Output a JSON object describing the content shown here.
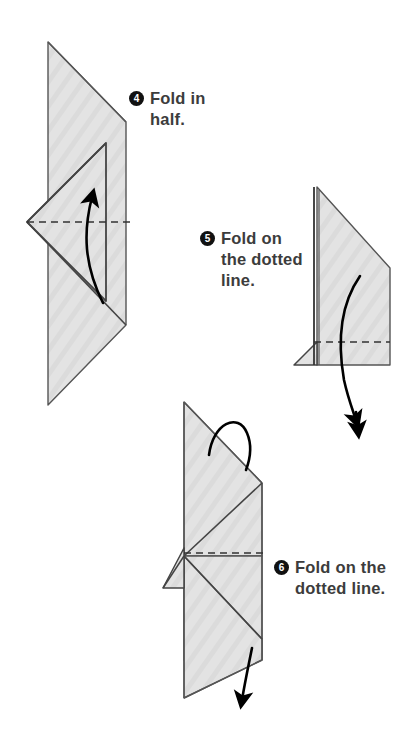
{
  "document": {
    "title": "Origami Folding Instructions",
    "background_color": "#ffffff"
  },
  "style": {
    "paper_fill": "#e2e2e2",
    "paper_stroke": "#4a4a4a",
    "text_color": "#3c3c3c",
    "badge_color": "#111111",
    "badge_text_color": "#ffffff",
    "arrow_color": "#000000",
    "dash_color": "#333333"
  },
  "steps": [
    {
      "number": "4",
      "badge": "4",
      "text": "Fold in\nhalf.",
      "instruction": "Fold in half.",
      "figure_name": "origami-figure-step-4",
      "has_dotted_line": true,
      "arrow_direction": "up",
      "caption_position": {
        "left": 129,
        "top": 88
      }
    },
    {
      "number": "5",
      "badge": "5",
      "text": "Fold on\nthe dotted\nline.",
      "instruction": "Fold on the dotted line.",
      "figure_name": "origami-figure-step-5",
      "has_dotted_line": true,
      "arrow_direction": "down",
      "caption_position": {
        "left": 200,
        "top": 228
      }
    },
    {
      "number": "6",
      "badge": "6",
      "text": "Fold on the\ndotted line.",
      "instruction": "Fold on the dotted line.",
      "figure_name": "origami-figure-step-6",
      "has_dotted_line": true,
      "arrow_direction": "down",
      "caption_position": {
        "left": 274,
        "top": 557
      }
    }
  ]
}
